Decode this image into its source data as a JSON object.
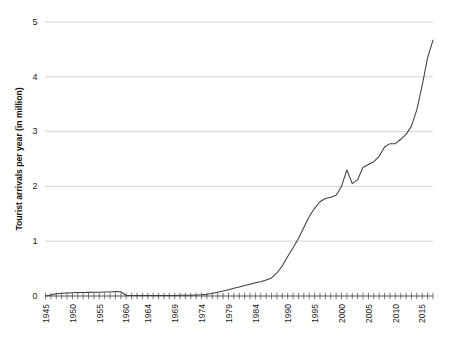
{
  "chart_data": {
    "type": "line",
    "title": "",
    "subtitle": "",
    "xlabel": "",
    "ylabel": "Tourist arrivals per year (in million)",
    "xlim": [
      1945,
      2017
    ],
    "ylim": [
      0,
      5
    ],
    "grid": true,
    "grid_axis": "y",
    "legend": false,
    "legend_position": "none",
    "y_ticks": [
      0,
      1,
      2,
      3,
      4,
      5
    ],
    "y_tick_labels": [
      "0",
      "1",
      "2",
      "3",
      "4",
      "5"
    ],
    "x_tick_labels": [
      "1945",
      "1950",
      "1955",
      "1960",
      "1964",
      "1969",
      "1974",
      "1979",
      "1984",
      "1990",
      "1995",
      "2000",
      "2005",
      "2010",
      "2015"
    ],
    "x_tick_values": [
      1945,
      1950,
      1955,
      1960,
      1964,
      1969,
      1974,
      1979,
      1984,
      1990,
      1995,
      2000,
      2005,
      2010,
      2015
    ],
    "x_minor_tick_step": 1,
    "line_color": "#3f3f3f",
    "grid_color": "#c8c8c8",
    "axis_color": "#555555",
    "background_color": "#ffffff",
    "series": [
      {
        "name": "Tourist arrivals",
        "x": [
          1945,
          1946,
          1947,
          1948,
          1949,
          1950,
          1951,
          1952,
          1953,
          1954,
          1955,
          1956,
          1957,
          1958,
          1959,
          1960,
          1961,
          1962,
          1963,
          1964,
          1965,
          1966,
          1967,
          1968,
          1969,
          1970,
          1971,
          1972,
          1973,
          1974,
          1975,
          1976,
          1977,
          1978,
          1979,
          1980,
          1981,
          1982,
          1983,
          1984,
          1985,
          1986,
          1987,
          1988,
          1989,
          1990,
          1991,
          1992,
          1993,
          1994,
          1995,
          1996,
          1997,
          1998,
          1999,
          2000,
          2001,
          2002,
          2003,
          2004,
          2005,
          2006,
          2007,
          2008,
          2009,
          2010,
          2011,
          2012,
          2013,
          2014,
          2015,
          2016,
          2017
        ],
        "values": [
          0.0,
          0.02,
          0.04,
          0.05,
          0.055,
          0.06,
          0.062,
          0.065,
          0.066,
          0.068,
          0.07,
          0.072,
          0.074,
          0.082,
          0.078,
          0.01,
          0.008,
          0.008,
          0.008,
          0.008,
          0.009,
          0.009,
          0.01,
          0.01,
          0.011,
          0.012,
          0.013,
          0.015,
          0.018,
          0.022,
          0.03,
          0.05,
          0.07,
          0.09,
          0.115,
          0.14,
          0.165,
          0.19,
          0.215,
          0.24,
          0.26,
          0.29,
          0.33,
          0.42,
          0.55,
          0.72,
          0.88,
          1.05,
          1.25,
          1.45,
          1.6,
          1.72,
          1.78,
          1.8,
          1.84,
          2.0,
          2.3,
          2.05,
          2.12,
          2.35,
          2.4,
          2.45,
          2.55,
          2.72,
          2.78,
          2.78,
          2.86,
          2.95,
          3.1,
          3.4,
          3.85,
          4.35,
          4.67
        ]
      }
    ]
  }
}
